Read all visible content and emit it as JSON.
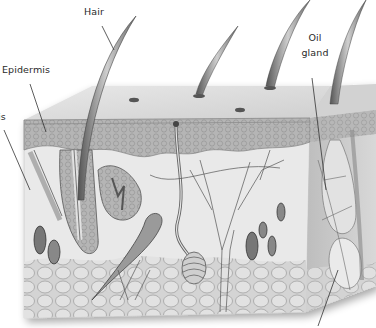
{
  "diagram": {
    "style": "grayscale anatomical illustration",
    "labels": [
      {
        "id": "hair",
        "text": "Hair"
      },
      {
        "id": "epidermis",
        "text": "Epidermis"
      },
      {
        "id": "dermis",
        "text": "is"
      },
      {
        "id": "oil_gland_1",
        "text": "Oil"
      },
      {
        "id": "oil_gland_2",
        "text": "gland"
      }
    ],
    "colors": {
      "outline": "#3a3a3a",
      "epidermis": "#a9a9a9",
      "dermis": "#e6e6e6",
      "fat": "#cfcfcf",
      "top_surface": "#d9d9d9",
      "side_face": "#c4c4c4"
    }
  }
}
